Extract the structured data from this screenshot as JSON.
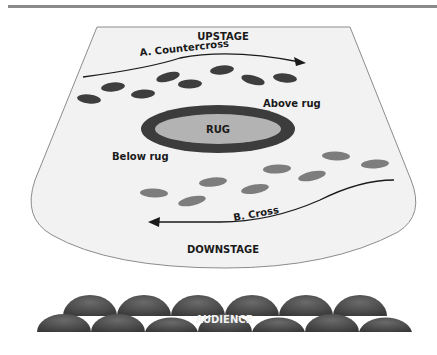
{
  "diagram": {
    "type": "stage-blocking",
    "colors": {
      "header_bar": "#8a8a8a",
      "stage_fill": "#f2f2f2",
      "stage_border": "#8c8c8c",
      "rug_ring": "#3c3c3c",
      "rug_fill": "#b3b3b3",
      "footprints_upper": "#3e3e3e",
      "footprints_lower": "#7d7d7d",
      "audience": "#4a4a4a"
    },
    "labels": {
      "upstage": "UPSTAGE",
      "downstage": "DOWNSTAGE",
      "rug": "RUG",
      "above_rug": "Above rug",
      "below_rug": "Below rug",
      "audience": "AUDIENCE"
    },
    "paths": [
      {
        "id": "A",
        "label": "A.  Countercross",
        "direction": "left-to-right",
        "position": "above rug"
      },
      {
        "id": "B",
        "label": "B.  Cross",
        "direction": "right-to-left",
        "position": "below rug"
      }
    ],
    "footprints": {
      "upper": [
        [
          89,
          99
        ],
        [
          113,
          87
        ],
        [
          143,
          94
        ],
        [
          168,
          77
        ],
        [
          190,
          84
        ],
        [
          222,
          70
        ],
        [
          253,
          80
        ],
        [
          285,
          78
        ]
      ],
      "lower": [
        [
          154,
          193
        ],
        [
          192,
          201
        ],
        [
          213,
          182
        ],
        [
          255,
          189
        ],
        [
          277,
          169
        ],
        [
          312,
          176
        ],
        [
          336,
          156
        ],
        [
          375,
          164
        ]
      ]
    },
    "audience_rows": {
      "back_row_seats": 6,
      "front_row_seats": 7
    }
  }
}
